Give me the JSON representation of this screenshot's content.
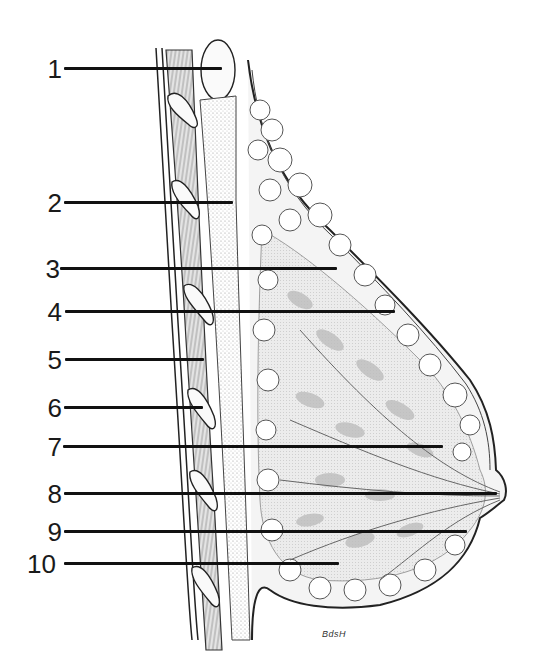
{
  "diagram": {
    "signature": "BdsH",
    "colors": {
      "ink": "#111111",
      "tissue_gray": "#b8b8b8",
      "background": "#ffffff"
    },
    "labels": [
      {
        "number": "1",
        "y": 68,
        "x_end": 222
      },
      {
        "number": "2",
        "y": 202,
        "x_end": 233
      },
      {
        "number": "3",
        "y": 268,
        "x_end": 337
      },
      {
        "number": "4",
        "y": 311,
        "x_end": 395
      },
      {
        "number": "5",
        "y": 359,
        "x_end": 204
      },
      {
        "number": "6",
        "y": 407,
        "x_end": 203
      },
      {
        "number": "7",
        "y": 446,
        "x_end": 443
      },
      {
        "number": "8",
        "y": 493,
        "x_end": 497
      },
      {
        "number": "9",
        "y": 531,
        "x_end": 467
      },
      {
        "number": "10",
        "y": 563,
        "x_end": 339
      }
    ]
  }
}
